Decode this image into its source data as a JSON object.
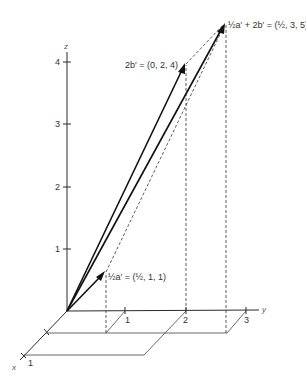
{
  "figure": {
    "axes": {
      "x_label": "x",
      "y_label": "y",
      "z_label": "z",
      "x_ticks": [
        "1"
      ],
      "y_ticks": [
        "1",
        "2",
        "3"
      ],
      "z_ticks": [
        "1",
        "2",
        "3",
        "4"
      ]
    },
    "vectors": [
      {
        "name": "half-a-prime",
        "label": "½a′ = (½, 1, 1)",
        "components": [
          0.5,
          1,
          1
        ]
      },
      {
        "name": "two-b-prime",
        "label": "2b′ = (0, 2, 4)",
        "components": [
          0,
          2,
          4
        ]
      },
      {
        "name": "sum",
        "label": "½a′ + 2b′ = (½, 3, 5)",
        "components": [
          0.5,
          3,
          5
        ]
      }
    ],
    "colors": {
      "ink": "#111111",
      "background": "#ffffff"
    }
  }
}
